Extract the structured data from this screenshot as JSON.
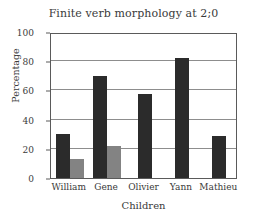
{
  "chart_data": {
    "type": "bar",
    "title": "Finite verb morphology at 2;0",
    "xlabel": "Children",
    "ylabel": "Percentage",
    "categories": [
      "William",
      "Gene",
      "Olivier",
      "Yann",
      "Mathieu"
    ],
    "series": [
      {
        "name": "series-1",
        "color": "#2b2b2b",
        "values": [
          30,
          70,
          57.5,
          82,
          29
        ]
      },
      {
        "name": "series-2",
        "color": "#838383",
        "values": [
          13,
          22,
          null,
          null,
          null
        ]
      }
    ],
    "ylim": [
      0,
      100
    ],
    "yticks": [
      0,
      20,
      40,
      60,
      80,
      100
    ],
    "ytick_labels": [
      "0",
      "20",
      "40",
      "60",
      "80",
      "100"
    ],
    "grid": "horizontal",
    "legend": "none"
  },
  "colors": {
    "background": "#ffffff",
    "axis": "#5a5a5a",
    "grid": "#8d8d8d",
    "text": "#3a3a3a",
    "bar_dark": "#2b2b2b",
    "bar_gray": "#838383"
  }
}
